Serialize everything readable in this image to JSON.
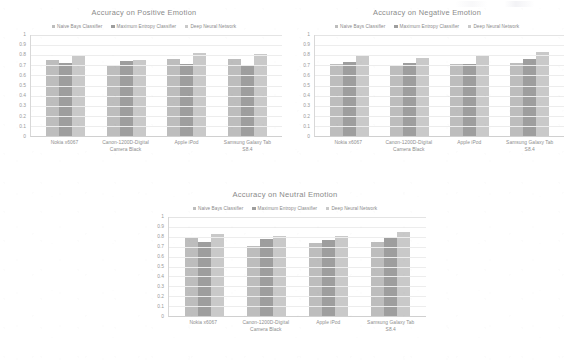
{
  "page": {
    "background_color": "#ffffff",
    "text_color": "#8d8d8d"
  },
  "series_colors": {
    "naive_bayes": "#bdbdbd",
    "maximum_entropy": "#9e9e9e",
    "deep_neural_network": "#c9c9c9"
  },
  "legend": {
    "items": [
      {
        "label": "Naive Bays Classifier",
        "color": "#bdbdbd"
      },
      {
        "label": "Maximum Entropy Classifier",
        "color": "#9e9e9e"
      },
      {
        "label": "Deep Neural Network",
        "color": "#c9c9c9"
      }
    ]
  },
  "y_axis": {
    "ticks": [
      "1",
      "0.9",
      "0.8",
      "0.7",
      "0.6",
      "0.5",
      "0.4",
      "0.3",
      "0.2",
      "0.1",
      "0"
    ]
  },
  "categories": [
    "Nokia x6067",
    "Canon-1200D-Digital Camera Black",
    "Apple iPod",
    "Samsung Galaxy Tab S8.4"
  ],
  "charts": [
    {
      "id": "positive",
      "title": "Accuracy on Positive Emotion"
    },
    {
      "id": "negative",
      "title": "Accuracy on Negative Emotion"
    },
    {
      "id": "neutral",
      "title": "Accuracy on Neutral Emotion"
    }
  ],
  "chart_data": [
    {
      "type": "bar",
      "title": "Accuracy on Positive Emotion",
      "xlabel": "",
      "ylabel": "",
      "ylim": [
        0,
        1
      ],
      "grid": true,
      "legend_position": "top-center",
      "categories": [
        "Nokia x6067",
        "Canon-1200D-Digital Camera Black",
        "Apple iPod",
        "Samsung Galaxy Tab S8.4"
      ],
      "series": [
        {
          "name": "Naive Bays Classifier",
          "values": [
            0.75,
            0.7,
            0.76,
            0.76
          ]
        },
        {
          "name": "Maximum Entropy Classifier",
          "values": [
            0.72,
            0.745,
            0.71,
            0.705
          ]
        },
        {
          "name": "Deep Neural Network",
          "values": [
            0.8,
            0.755,
            0.82,
            0.815
          ]
        }
      ]
    },
    {
      "type": "bar",
      "title": "Accuracy on Negative Emotion",
      "xlabel": "",
      "ylabel": "",
      "ylim": [
        0,
        1
      ],
      "grid": true,
      "legend_position": "top-center",
      "categories": [
        "Nokia x6067",
        "Canon-1200D-Digital Camera Black",
        "Apple iPod",
        "Samsung Galaxy Tab S8.4"
      ],
      "series": [
        {
          "name": "Naive Bays Classifier",
          "values": [
            0.71,
            0.69,
            0.71,
            0.72
          ]
        },
        {
          "name": "Maximum Entropy Classifier",
          "values": [
            0.735,
            0.72,
            0.71,
            0.765
          ]
        },
        {
          "name": "Deep Neural Network",
          "values": [
            0.79,
            0.77,
            0.8,
            0.83
          ]
        }
      ]
    },
    {
      "type": "bar",
      "title": "Accuracy on Neutral Emotion",
      "xlabel": "",
      "ylabel": "",
      "ylim": [
        0,
        1
      ],
      "grid": true,
      "legend_position": "top-center",
      "categories": [
        "Nokia x6067",
        "Canon-1200D-Digital Camera Black",
        "Apple iPod",
        "Samsung Galaxy Tab S8.4"
      ],
      "series": [
        {
          "name": "Naive Bays Classifier",
          "values": [
            0.8,
            0.71,
            0.735,
            0.75
          ]
        },
        {
          "name": "Maximum Entropy Classifier",
          "values": [
            0.745,
            0.775,
            0.77,
            0.795
          ]
        },
        {
          "name": "Deep Neural Network",
          "values": [
            0.825,
            0.81,
            0.805,
            0.845
          ]
        }
      ]
    }
  ]
}
